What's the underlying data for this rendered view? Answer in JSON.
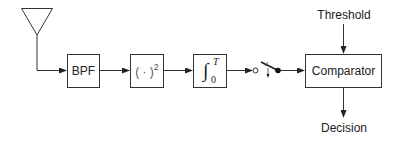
{
  "diagram": {
    "title": "",
    "blocks": {
      "bpf": {
        "label": "BPF"
      },
      "squarer": {
        "label": "( · )",
        "exponent": "2"
      },
      "integrator": {
        "symbol": "∫",
        "upper": "T",
        "lower": "0"
      },
      "comparator": {
        "label": "Comparator"
      }
    },
    "inputs": {
      "threshold": "Threshold"
    },
    "outputs": {
      "decision": "Decision"
    },
    "elements": [
      "antenna",
      "bandpass-filter",
      "squarer",
      "integrator",
      "sampling-switch",
      "comparator"
    ],
    "colors": {
      "stroke": "#333333",
      "text": "#222222",
      "background": "#ffffff"
    }
  }
}
